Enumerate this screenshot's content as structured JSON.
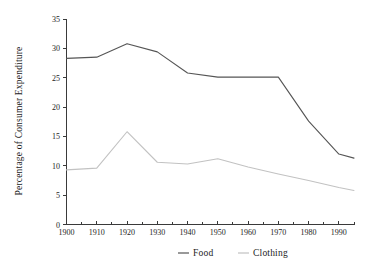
{
  "chart_data": {
    "type": "line",
    "title": "",
    "xlabel": "",
    "ylabel": "Percentage of Consumer Expenditure",
    "xlim": [
      1900,
      1995
    ],
    "ylim": [
      0,
      35
    ],
    "grid": false,
    "legend_position": "bottom-center",
    "x_ticks": [
      1900,
      1910,
      1920,
      1930,
      1940,
      1950,
      1960,
      1970,
      1980,
      1990
    ],
    "x_minor_ticks": [
      1905,
      1915,
      1925,
      1935,
      1945,
      1955,
      1965,
      1975,
      1985,
      1995
    ],
    "y_ticks": [
      0,
      5,
      10,
      15,
      20,
      25,
      30,
      35
    ],
    "x": [
      1900,
      1910,
      1920,
      1930,
      1940,
      1950,
      1960,
      1970,
      1980,
      1990,
      1995
    ],
    "series": [
      {
        "name": "Food",
        "color": "#555555",
        "values": [
          28.3,
          28.5,
          30.8,
          29.4,
          25.8,
          25.1,
          25.1,
          25.1,
          17.6,
          12.0,
          11.3
        ]
      },
      {
        "name": "Clothing",
        "color": "#c2c2c2",
        "values": [
          9.3,
          9.6,
          15.8,
          10.6,
          10.3,
          11.2,
          9.8,
          8.6,
          7.5,
          6.3,
          5.8
        ]
      }
    ]
  },
  "axis": {
    "y_title": "Percentage of Consumer Expenditure",
    "y_tick_labels": [
      "0",
      "5",
      "10",
      "15",
      "20",
      "25",
      "30",
      "35"
    ],
    "x_tick_labels": [
      "1900",
      "1910",
      "1920",
      "1930",
      "1940",
      "1950",
      "1960",
      "1970",
      "1980",
      "1990"
    ]
  },
  "legend": {
    "items": [
      {
        "label": "Food",
        "color": "#555555"
      },
      {
        "label": "Clothing",
        "color": "#c2c2c2"
      }
    ]
  }
}
